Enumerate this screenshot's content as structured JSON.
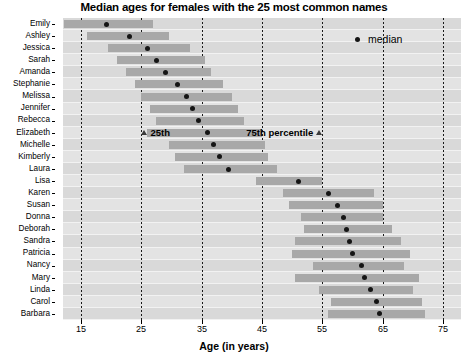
{
  "chart_data": {
    "type": "bar",
    "title": "Median ages for females with the 25 most common names",
    "xlabel": "Age (in years)",
    "ylabel": "",
    "xlim": [
      12,
      78
    ],
    "xticks": [
      15,
      25,
      35,
      45,
      55,
      65,
      75
    ],
    "xtick_labels": [
      "15",
      "25",
      "35",
      "45",
      "55",
      "65",
      "75"
    ],
    "grid": true,
    "legend_position": "top-right",
    "legend": [
      {
        "marker": "dot",
        "label": "median"
      }
    ],
    "annotations": [
      {
        "label": "25th",
        "row": "Elizabeth",
        "value": 25.5
      },
      {
        "label": "75th percentile",
        "row": "Elizabeth",
        "value": 54.5
      }
    ],
    "categories": [
      "Emily",
      "Ashley",
      "Jessica",
      "Sarah",
      "Amanda",
      "Stephanie",
      "Melissa",
      "Jennifer",
      "Rebecca",
      "Elizabeth",
      "Michelle",
      "Kimberly",
      "Laura",
      "Lisa",
      "Karen",
      "Susan",
      "Donna",
      "Deborah",
      "Sandra",
      "Patricia",
      "Nancy",
      "Mary",
      "Linda",
      "Carol",
      "Barbara"
    ],
    "series": [
      {
        "name": "p25",
        "values": [
          12.1,
          16.0,
          19.5,
          21.0,
          22.5,
          24.0,
          25.0,
          26.5,
          27.5,
          26.0,
          29.5,
          30.5,
          32.0,
          44.0,
          48.5,
          49.5,
          51.5,
          52.0,
          50.5,
          50.0,
          53.5,
          50.5,
          54.5,
          56.5,
          56.0
        ]
      },
      {
        "name": "median",
        "values": [
          19.2,
          23.0,
          26.0,
          27.5,
          29.0,
          31.0,
          32.5,
          33.5,
          34.5,
          36.0,
          37.0,
          38.0,
          39.5,
          51.0,
          56.0,
          57.5,
          58.5,
          59.0,
          59.5,
          60.0,
          61.5,
          62.0,
          63.0,
          64.0,
          64.5
        ]
      },
      {
        "name": "p75",
        "values": [
          26.9,
          29.5,
          33.0,
          35.5,
          36.5,
          38.5,
          40.0,
          41.0,
          42.0,
          45.0,
          45.5,
          46.0,
          47.5,
          55.0,
          63.5,
          65.0,
          65.0,
          66.5,
          68.0,
          69.5,
          68.5,
          71.0,
          70.0,
          71.5,
          72.0
        ]
      }
    ]
  }
}
